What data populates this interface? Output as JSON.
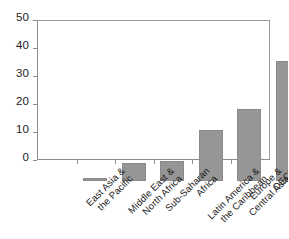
{
  "chart_data": {
    "type": "bar",
    "title": "",
    "subtitle": "",
    "xlabel": "",
    "ylabel": "",
    "categories": [
      "East Asia & the Pacific",
      "Middle East & North Africa",
      "Sub-Saharan Africa",
      "Latin America & the Caribbean",
      "Europe & Central Asia",
      "OECD"
    ],
    "category_lines": [
      [
        "East Asia &",
        "the Pacific"
      ],
      [
        "Middle East &",
        "North Africa"
      ],
      [
        "Sub-Saharan",
        "Africa"
      ],
      [
        "Latin America &",
        "the Caribbean"
      ],
      [
        "Europe &",
        "Central Asia"
      ],
      [
        "OECD",
        ""
      ]
    ],
    "values": [
      1.0,
      6.5,
      7.2,
      18.3,
      25.7,
      43.0
    ],
    "ylim": [
      0,
      50
    ],
    "yticks": [
      0,
      10,
      20,
      30,
      40,
      50
    ],
    "ytick_labels": [
      "0",
      "10",
      "20",
      "30",
      "40",
      "50"
    ],
    "grid": false,
    "legend": "none",
    "bar_color": "#969696",
    "bar_edge_color": "#8a8a8a",
    "axis_color": "#8d8d8d",
    "text_color": "#1c1c1c",
    "background": "#ffffff"
  }
}
